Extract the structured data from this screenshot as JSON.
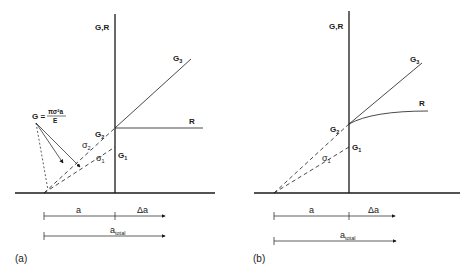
{
  "figure": {
    "panels": [
      {
        "tag": "(a)",
        "axis_label": "G,R",
        "curve_labels": {
          "G3": "G",
          "G3_sub": "3",
          "R": "R",
          "G2": "G",
          "G2_sub": "2",
          "G1": "G",
          "G1_sub": "1"
        },
        "stress_labels": {
          "s2": "σ",
          "s2_sub": "2",
          "s1": "σ",
          "s1_sub": "1"
        },
        "formula": {
          "lhs": "G =",
          "numerator": "πσ²a",
          "denominator": "E"
        },
        "dimensions": {
          "a": "a",
          "delta_a": "Δa",
          "a_total": "a",
          "a_total_sub": "total"
        }
      },
      {
        "tag": "(b)",
        "axis_label": "G,R",
        "curve_labels": {
          "G3": "G",
          "G3_sub": "3",
          "R": "R",
          "G2": "G",
          "G2_sub": "2",
          "G1": "G",
          "G1_sub": "1"
        },
        "stress_labels": {
          "s1": "σ",
          "s1_sub": "1"
        },
        "dimensions": {
          "a": "a",
          "delta_a": "Δa",
          "a_total": "a",
          "a_total_sub": "total"
        }
      }
    ]
  }
}
